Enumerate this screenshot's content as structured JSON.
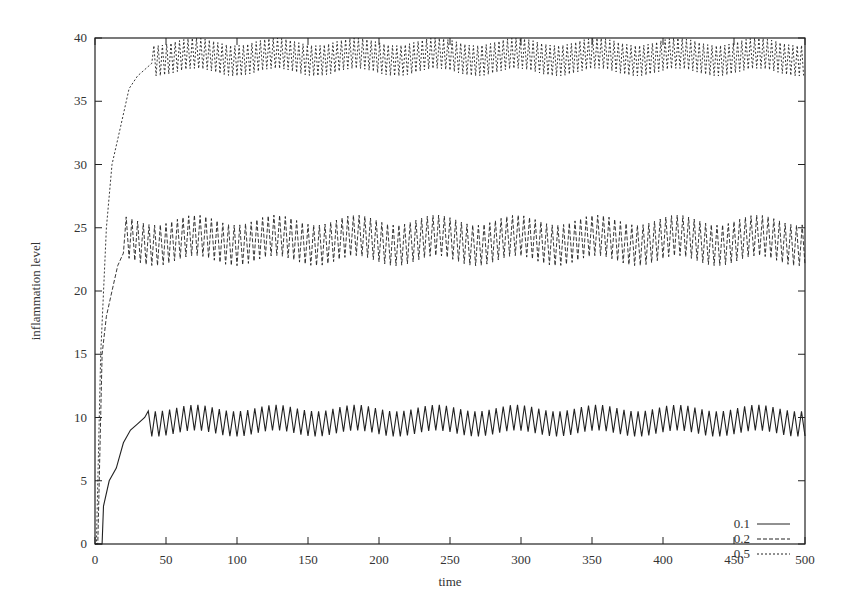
{
  "chart_data": {
    "type": "line",
    "title": "",
    "xlabel": "time",
    "ylabel": "inflammation level",
    "xlim": [
      0,
      500
    ],
    "ylim": [
      0,
      40
    ],
    "xticks": [
      0,
      50,
      100,
      150,
      200,
      250,
      300,
      350,
      400,
      450,
      500
    ],
    "yticks": [
      0,
      5,
      10,
      15,
      20,
      25,
      30,
      35,
      40
    ],
    "grid": false,
    "legend_position": "lower right",
    "series": [
      {
        "name": "0.1",
        "style": "solid",
        "description": "Rises from 0 at t≈5 to ~10 by t≈30, then oscillates between ~8.5 and ~11",
        "rise": [
          [
            5,
            0
          ],
          [
            6,
            3
          ],
          [
            10,
            5
          ],
          [
            15,
            6
          ],
          [
            20,
            8
          ],
          [
            25,
            9
          ],
          [
            30,
            9.5
          ],
          [
            35,
            10
          ]
        ],
        "steady_mean": 9.7,
        "steady_min": 8.5,
        "steady_max": 11,
        "oscillation_period": 5
      },
      {
        "name": "0.2",
        "style": "dashed",
        "description": "Rises from 0 to ~22 by t≈15, then oscillates between ~22 and ~26",
        "rise": [
          [
            2,
            0
          ],
          [
            5,
            15
          ],
          [
            8,
            18
          ],
          [
            12,
            20
          ],
          [
            16,
            22
          ],
          [
            20,
            23
          ]
        ],
        "steady_mean": 24,
        "steady_min": 22,
        "steady_max": 26,
        "oscillation_period": 4
      },
      {
        "name": "0.5",
        "style": "dotted",
        "description": "Rises steeply from 0 to ~37 by t≈30, then oscillates between ~37 and 40 (clipped at top)",
        "rise": [
          [
            1,
            0
          ],
          [
            4,
            15
          ],
          [
            8,
            25
          ],
          [
            12,
            30
          ],
          [
            18,
            33
          ],
          [
            24,
            36
          ],
          [
            30,
            37
          ],
          [
            40,
            38
          ]
        ],
        "steady_mean": 38.5,
        "steady_min": 37,
        "steady_max": 40,
        "oscillation_period": 3
      }
    ]
  },
  "plot": {
    "left": 95,
    "right": 805,
    "top": 38,
    "bottom": 544
  }
}
